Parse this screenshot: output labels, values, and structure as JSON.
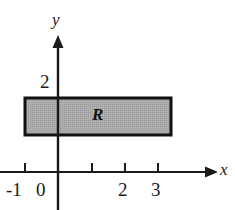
{
  "figure": {
    "background_color": "#ffffff",
    "ink_color": "#1a1a1a",
    "region_fill_color": "#a8a8a8",
    "region_border_color": "#111111"
  },
  "axes": {
    "x_axis": {
      "label": "x",
      "tick_labels": [
        "-1",
        "0",
        "2",
        "3"
      ],
      "tick_values": [
        -1,
        0,
        2,
        3
      ],
      "unlabeled_ticks": [
        1
      ],
      "range": [
        -1.8,
        4.8
      ],
      "arrow": "right"
    },
    "y_axis": {
      "label": "y",
      "tick_labels": [
        "2"
      ],
      "tick_values": [
        2
      ],
      "range": [
        -1.05,
        4.05
      ],
      "arrow": "up"
    },
    "origin_label": "0",
    "grid": false
  },
  "region": {
    "name": "R",
    "label": "R",
    "x_min": -1,
    "x_max": 3.4,
    "y_min": 0.85,
    "y_max": 2.0,
    "fill": "#a8a8a8",
    "stroke": "#111111"
  }
}
